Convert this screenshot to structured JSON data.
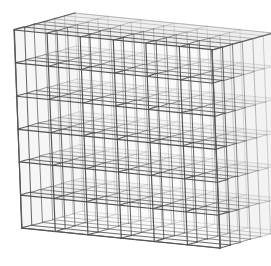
{
  "figure": {
    "background_color": "#ffffff"
  },
  "chart_data": {
    "type": "diagram",
    "subtype": "3d-voxel-lattice",
    "title": "",
    "subtitle": "",
    "xlabel": "",
    "ylabel": "",
    "zlabel": "",
    "grid": true,
    "legend": null,
    "annotations": [],
    "divisions": {
      "x": 6,
      "y": 6,
      "z": 6
    },
    "total_cells": 216,
    "projection": {
      "type": "oblique-parallel",
      "origin_px": [
        14,
        30
      ],
      "axis_x_px": [
        198,
        20
      ],
      "axis_y_px": [
        8,
        198
      ],
      "axis_z_px": [
        61,
        -17
      ]
    },
    "bounding_corners_px": {
      "front_top_left": [
        14,
        30
      ],
      "front_top_right": [
        212,
        50
      ],
      "front_bottom_left": [
        22,
        228
      ],
      "front_bottom_right": [
        220,
        248
      ],
      "back_top_left": [
        75,
        13
      ],
      "back_top_right": [
        273,
        33
      ],
      "back_bottom_left": [
        83,
        211
      ],
      "back_bottom_right": [
        281,
        231
      ]
    },
    "style": {
      "edge_color": "#4a4a4a",
      "edge_color_far": "#9a9a9a",
      "edge_width_near": 1.15,
      "edge_width_far": 0.55,
      "face_fill_top": "#d9d9d9",
      "face_fill_front": "#f0f0f0",
      "face_fill_side": "#e2e2e2",
      "face_opacity": 0.22
    }
  }
}
